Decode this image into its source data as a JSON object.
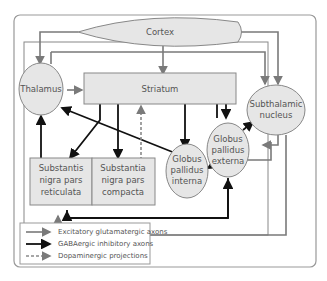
{
  "nodes": {
    "cortex": "Cortex",
    "thalamus": "Thalamus",
    "striatum": "Striatum",
    "stn": [
      "Subthalamic",
      "nucleus"
    ],
    "gpe": [
      "Globus",
      "pallidus",
      "externa"
    ],
    "gpi": [
      "Globus",
      "pallidus",
      "interna"
    ],
    "snr": [
      "Substantis",
      "nigra pars",
      "reticulata"
    ],
    "snc": [
      "Substantia",
      "nigra pars",
      "compacta"
    ]
  },
  "legend": {
    "excitatory": "Excitatory glutamatergic axons",
    "gaba": "GABAergic inhibitory axons",
    "dopamine": "Dopaminergic projections"
  },
  "colors": {
    "excitatory": "#7a7a7a",
    "gaba": "#111111",
    "dopamine": "#8a8a8a",
    "node_fill": "#e6e6e6"
  }
}
